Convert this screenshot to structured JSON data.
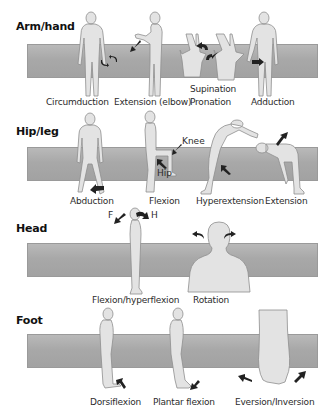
{
  "sections": [
    {
      "title": "Arm/hand",
      "movements": [
        {
          "label": "Circumduction"
        },
        {
          "label": "Extension (elbow)"
        },
        {
          "label": "Supination"
        },
        {
          "label": "Pronation"
        },
        {
          "label": "Adduction"
        }
      ]
    },
    {
      "title": "Hip/leg",
      "movements": [
        {
          "label": "Abduction"
        },
        {
          "label": "Flexion",
          "annotations": [
            "Knee",
            "Hip"
          ]
        },
        {
          "label": "Hyperextension"
        },
        {
          "label": "Extension"
        }
      ]
    },
    {
      "title": "Head",
      "movements": [
        {
          "label": "Flexion/hyperflexion",
          "annotations": [
            "F",
            "H"
          ]
        },
        {
          "label": "Rotation"
        }
      ]
    },
    {
      "title": "Foot",
      "movements": [
        {
          "label": "Dorsiflexion"
        },
        {
          "label": "Plantar flexion"
        },
        {
          "label": "Eversion/Inversion"
        }
      ]
    }
  ],
  "colors": {
    "band": "#aaaaaa",
    "figure": "#e3e3e3",
    "figure_outline": "#8e8e8e",
    "arrow": "#222222"
  }
}
